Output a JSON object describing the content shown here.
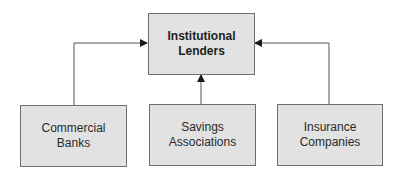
{
  "diagram": {
    "top_node": {
      "line1": "Institutional",
      "line2": "Lenders"
    },
    "nodes": [
      {
        "line1": "Commercial",
        "line2": "Banks"
      },
      {
        "line1": "Savings",
        "line2": "Associations"
      },
      {
        "line1": "Insurance",
        "line2": "Companies"
      }
    ],
    "edges": [
      {
        "from": "Commercial Banks",
        "to": "Institutional Lenders"
      },
      {
        "from": "Savings Associations",
        "to": "Institutional Lenders"
      },
      {
        "from": "Insurance Companies",
        "to": "Institutional Lenders"
      }
    ],
    "colors": {
      "box_fill": "#e2e2e2",
      "box_border": "#6e6e6e",
      "line": "#555555"
    }
  }
}
